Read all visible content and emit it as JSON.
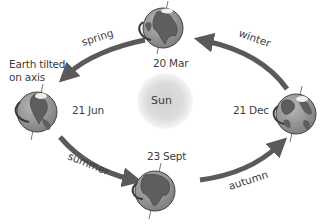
{
  "diagram": {
    "center": {
      "label": "Sun"
    },
    "annotation": {
      "line1": "Earth tilted",
      "line2": "on axis"
    },
    "positions": [
      {
        "id": "top",
        "date": "20 Mar"
      },
      {
        "id": "left",
        "date": "21 Jun"
      },
      {
        "id": "bottom",
        "date": "23 Sept"
      },
      {
        "id": "right",
        "date": "21 Dec"
      }
    ],
    "seasons": [
      {
        "label": "spring",
        "from": "20 Mar",
        "to": "21 Jun"
      },
      {
        "label": "summer",
        "from": "21 Jun",
        "to": "23 Sept"
      },
      {
        "label": "autumn",
        "from": "23 Sept",
        "to": "21 Dec"
      },
      {
        "label": "winter",
        "from": "21 Dec",
        "to": "20 Mar"
      }
    ],
    "colors": {
      "arrow": "#5a5a5a",
      "ocean": "#8c8c8c",
      "land": "#6b6b6b",
      "sun_core": "#d4d4d4",
      "sun_edge": "#f4f4f4",
      "text": "#3c3c3c"
    }
  }
}
